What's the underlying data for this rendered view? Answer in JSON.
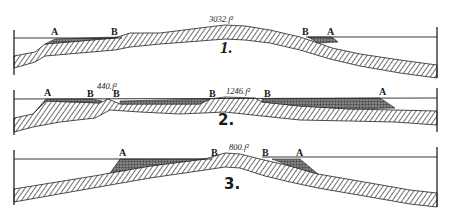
{
  "figure": {
    "colors": {
      "ink": "#1a1a1a",
      "background": "#ffffff",
      "deposit": "#555555"
    },
    "sections": [
      {
        "number": "1.",
        "elevation_label": "3032.f²",
        "labels": [
          "A",
          "B",
          "B",
          "A"
        ]
      },
      {
        "number": "2.",
        "elevation_labels": [
          "440.f²",
          "1246.f²"
        ],
        "labels": [
          "A",
          "B",
          "B",
          "B",
          "B",
          "A"
        ]
      },
      {
        "number": "3.",
        "elevation_label": "800.f²",
        "labels": [
          "A",
          "B",
          "B",
          "A"
        ]
      }
    ]
  }
}
